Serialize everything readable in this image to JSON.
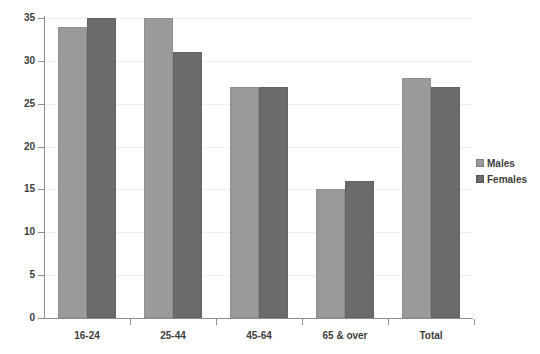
{
  "chart_data": {
    "type": "bar",
    "title": "",
    "subtitle": "",
    "xlabel": "",
    "ylabel": "",
    "categories": [
      "16-24",
      "25-44",
      "45-64",
      "65 & over",
      "Total"
    ],
    "series": [
      {
        "name": "Males",
        "color": "#9a9a9a",
        "values": [
          34,
          35,
          27,
          15,
          28
        ]
      },
      {
        "name": "Females",
        "color": "#6b6b6b",
        "values": [
          35,
          31,
          27,
          16,
          27
        ]
      }
    ],
    "ylim": [
      0,
      35
    ],
    "ytick_labels": [
      "0",
      "5",
      "10",
      "15",
      "20",
      "25",
      "30",
      "35"
    ],
    "ytick_values": [
      0,
      5,
      10,
      15,
      20,
      25,
      30,
      35
    ],
    "grid": true,
    "legend_position": "right"
  },
  "legend": {
    "items": [
      {
        "label": "Males"
      },
      {
        "label": "Females"
      }
    ]
  }
}
